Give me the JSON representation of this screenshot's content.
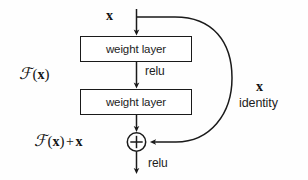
{
  "figure": {
    "background_color": "#fefefe",
    "stroke_color": "#1a1a1a"
  },
  "blocks": [
    {
      "id": "weight-layer-1",
      "label": "weight layer"
    },
    {
      "id": "weight-layer-2",
      "label": "weight layer"
    }
  ],
  "labels": {
    "input_x": "x",
    "function_fx": "F(x)",
    "function_fx_script": "ℱ",
    "function_fx_paren_open": "(",
    "function_fx_var": "x",
    "function_fx_paren_close": ")",
    "plus_sign": "+",
    "output_sum": "F(x) + x",
    "relu_middle": "relu",
    "relu_bottom": "relu",
    "skip_x": "x",
    "skip_identity": "identity",
    "addition_operator": "+"
  },
  "connections": [
    {
      "from": "input",
      "to": "weight-layer-1",
      "kind": "arrow-down"
    },
    {
      "from": "weight-layer-1",
      "to": "weight-layer-2",
      "kind": "arrow-down",
      "annotation": "relu"
    },
    {
      "from": "weight-layer-2",
      "to": "addition",
      "kind": "arrow-down"
    },
    {
      "from": "input",
      "to": "addition",
      "kind": "curved-skip",
      "annotation": "x identity"
    },
    {
      "from": "addition",
      "to": "output",
      "kind": "arrow-down",
      "annotation": "relu"
    }
  ]
}
